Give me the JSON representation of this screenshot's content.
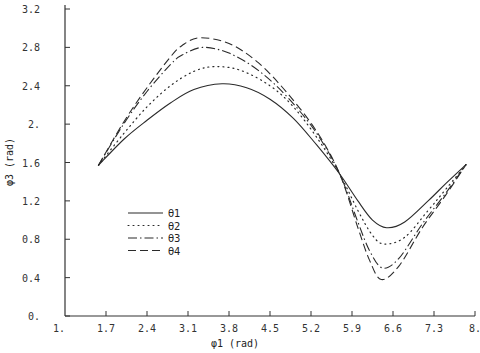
{
  "chart_data": {
    "type": "line",
    "title": "",
    "xlabel": "φ1 (rad)",
    "ylabel": "φ3 (rad)",
    "xlim": [
      1.0,
      8.0
    ],
    "ylim": [
      0.0,
      3.2
    ],
    "xticks": [
      "1.",
      "1.7",
      "2.4",
      "3.1",
      "3.8",
      "4.5",
      "5.2",
      "5.9",
      "6.6",
      "7.3",
      "8."
    ],
    "xtick_values": [
      1.0,
      1.7,
      2.4,
      3.1,
      3.8,
      4.5,
      5.2,
      5.9,
      6.6,
      7.3,
      8.0
    ],
    "yticks": [
      "0.",
      "0.4",
      "0.8",
      "1.2",
      "1.6",
      "2.",
      "2.4",
      "2.8",
      "3.2"
    ],
    "ytick_values": [
      0.0,
      0.4,
      0.8,
      1.2,
      1.6,
      2.0,
      2.4,
      2.8,
      3.2
    ],
    "grid": false,
    "legend_position": "lower-left inside",
    "series": [
      {
        "name": "θ1",
        "style": "solid",
        "x": [
          1.57,
          2.0,
          2.4,
          2.8,
          3.2,
          3.68,
          4.1,
          4.5,
          4.9,
          5.3,
          5.69,
          6.0,
          6.25,
          6.49,
          6.8,
          7.2,
          7.5,
          7.85
        ],
        "y": [
          1.57,
          1.84,
          2.04,
          2.22,
          2.36,
          2.42,
          2.38,
          2.26,
          2.06,
          1.78,
          1.48,
          1.2,
          1.0,
          0.92,
          0.98,
          1.2,
          1.38,
          1.58
        ]
      },
      {
        "name": "θ2",
        "style": "dotted",
        "x": [
          1.57,
          2.0,
          2.4,
          2.8,
          3.2,
          3.56,
          4.0,
          4.5,
          4.9,
          5.3,
          5.69,
          6.0,
          6.25,
          6.45,
          6.8,
          7.2,
          7.5,
          7.85
        ],
        "y": [
          1.57,
          1.9,
          2.18,
          2.4,
          2.55,
          2.6,
          2.56,
          2.4,
          2.18,
          1.86,
          1.48,
          1.1,
          0.84,
          0.75,
          0.82,
          1.1,
          1.32,
          1.58
        ]
      },
      {
        "name": "θ3",
        "style": "dash-dot",
        "x": [
          1.57,
          2.0,
          2.4,
          2.8,
          3.0,
          3.35,
          3.8,
          4.3,
          4.8,
          5.3,
          5.69,
          6.0,
          6.2,
          6.42,
          6.7,
          7.1,
          7.5,
          7.85
        ],
        "y": [
          1.57,
          2.0,
          2.34,
          2.62,
          2.72,
          2.8,
          2.74,
          2.56,
          2.28,
          1.9,
          1.48,
          0.98,
          0.68,
          0.5,
          0.6,
          0.96,
          1.28,
          1.58
        ]
      },
      {
        "name": "θ4",
        "style": "dashed",
        "x": [
          1.57,
          2.0,
          2.4,
          2.8,
          3.0,
          3.3,
          3.8,
          4.3,
          4.8,
          5.3,
          5.69,
          6.0,
          6.2,
          6.4,
          6.7,
          7.1,
          7.5,
          7.85
        ],
        "y": [
          1.57,
          2.02,
          2.38,
          2.7,
          2.82,
          2.9,
          2.84,
          2.64,
          2.32,
          1.92,
          1.48,
          0.92,
          0.58,
          0.38,
          0.52,
          0.92,
          1.26,
          1.58
        ]
      }
    ]
  },
  "colors": {
    "line": "#2a2a2a",
    "axis": "#333333",
    "background": "#ffffff"
  }
}
